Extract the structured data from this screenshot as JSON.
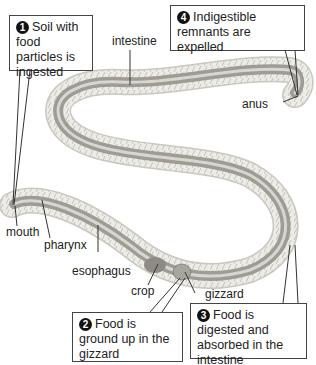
{
  "diagram": {
    "steps": [
      {
        "number": "1",
        "text": "Soil with food particles is ingested"
      },
      {
        "number": "2",
        "text": "Food is ground up in the gizzard"
      },
      {
        "number": "3",
        "text": "Food is digested and absorbed in the intestine"
      },
      {
        "number": "4",
        "text": "Indigestible remnants are expelled"
      }
    ],
    "labels": {
      "intestine": "intestine",
      "anus": "anus",
      "mouth": "mouth",
      "pharynx": "pharynx",
      "esophagus": "esophagus",
      "crop": "crop",
      "gizzard": "gizzard"
    }
  }
}
